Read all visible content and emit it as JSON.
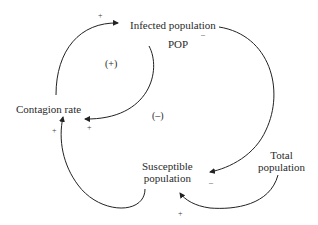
{
  "diagram": {
    "type": "causal-loop",
    "nodes": [
      {
        "id": "infected",
        "label": "Infected population"
      },
      {
        "id": "pop",
        "label": "POP"
      },
      {
        "id": "contagion",
        "label": "Contagion rate"
      },
      {
        "id": "susceptible",
        "label_line1": "Susceptible",
        "label_line2": "population"
      },
      {
        "id": "total",
        "label_line1": "Total",
        "label_line2": "population"
      }
    ],
    "loops": [
      {
        "id": "reinforcing",
        "label": "(+)"
      },
      {
        "id": "balancing",
        "label": "(–)"
      }
    ],
    "links": [
      {
        "from": "contagion",
        "to": "infected",
        "polarity": "+"
      },
      {
        "from": "infected",
        "to": "contagion",
        "polarity": "+"
      },
      {
        "from": "infected",
        "to": "susceptible",
        "polarity": "–"
      },
      {
        "from": "susceptible",
        "to": "contagion",
        "polarity": "+"
      },
      {
        "from": "total",
        "to": "susceptible",
        "polarity": "+"
      }
    ]
  }
}
